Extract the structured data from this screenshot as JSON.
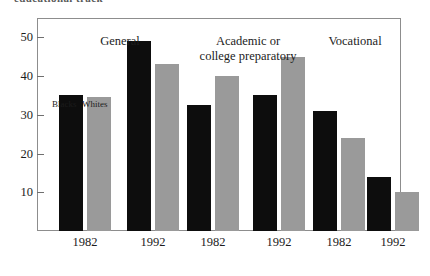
{
  "figure": {
    "caption_sliver": "educational track",
    "frame_color": "#8d8d8d",
    "background": "#ffffff"
  },
  "legend": {
    "entries": [
      {
        "label": "Blacks",
        "color": "#0d0d0d"
      },
      {
        "label": "Whites",
        "color": "#9a9a9a"
      }
    ]
  },
  "chart_data": {
    "type": "bar",
    "title": "",
    "xlabel": "",
    "ylabel": "",
    "ylim": [
      0,
      55
    ],
    "yticks": [
      10,
      20,
      30,
      40,
      50
    ],
    "grid": false,
    "legend_position": "inside-upper-left",
    "groups": [
      {
        "name": "General",
        "categories": [
          "1982",
          "1992"
        ],
        "series": [
          {
            "name": "Blacks",
            "color": "#0d0d0d",
            "values": [
              35,
              49
            ]
          },
          {
            "name": "Whites",
            "color": "#9a9a9a",
            "values": [
              34.5,
              43
            ]
          }
        ]
      },
      {
        "name": "Academic or\ncollege preparatory",
        "heading_line1": "Academic or",
        "heading_line2": "college preparatory",
        "categories": [
          "1982",
          "1992"
        ],
        "series": [
          {
            "name": "Blacks",
            "color": "#0d0d0d",
            "values": [
              32.5,
              35
            ]
          },
          {
            "name": "Whites",
            "color": "#9a9a9a",
            "values": [
              40,
              45
            ]
          }
        ]
      },
      {
        "name": "Vocational",
        "categories": [
          "1982",
          "1992"
        ],
        "series": [
          {
            "name": "Blacks",
            "color": "#0d0d0d",
            "values": [
              31,
              14
            ]
          },
          {
            "name": "Whites",
            "color": "#9a9a9a",
            "values": [
              24,
              10
            ]
          }
        ]
      }
    ],
    "bars": [
      {
        "group": "General",
        "category": "1982",
        "series": "Blacks",
        "value": 35
      },
      {
        "group": "General",
        "category": "1982",
        "series": "Whites",
        "value": 34.5
      },
      {
        "group": "General",
        "category": "1992",
        "series": "Blacks",
        "value": 49
      },
      {
        "group": "General",
        "category": "1992",
        "series": "Whites",
        "value": 43
      },
      {
        "group": "Academic or college preparatory",
        "category": "1982",
        "series": "Blacks",
        "value": 32.5
      },
      {
        "group": "Academic or college preparatory",
        "category": "1982",
        "series": "Whites",
        "value": 40
      },
      {
        "group": "Academic or college preparatory",
        "category": "1992",
        "series": "Blacks",
        "value": 35
      },
      {
        "group": "Academic or college preparatory",
        "category": "1992",
        "series": "Whites",
        "value": 45
      },
      {
        "group": "Vocational",
        "category": "1982",
        "series": "Blacks",
        "value": 31
      },
      {
        "group": "Vocational",
        "category": "1982",
        "series": "Whites",
        "value": 24
      },
      {
        "group": "Vocational",
        "category": "1992",
        "series": "Blacks",
        "value": 14
      },
      {
        "group": "Vocational",
        "category": "1992",
        "series": "Whites",
        "value": 10
      }
    ],
    "xtick_labels": [
      "1982",
      "1992",
      "1982",
      "1992",
      "1982",
      "1992"
    ]
  }
}
